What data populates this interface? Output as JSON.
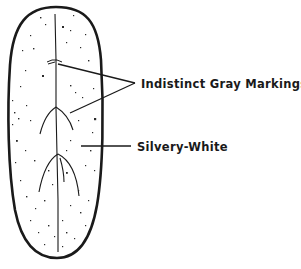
{
  "diagram": {
    "colors": {
      "outline": "#1a1a1a",
      "speckle": "#2a2a2a",
      "background": "#ffffff",
      "text": "#1a1a1a"
    },
    "labels": {
      "markings": "Indistinct Gray Markings",
      "surface": "Silvery-White"
    }
  }
}
